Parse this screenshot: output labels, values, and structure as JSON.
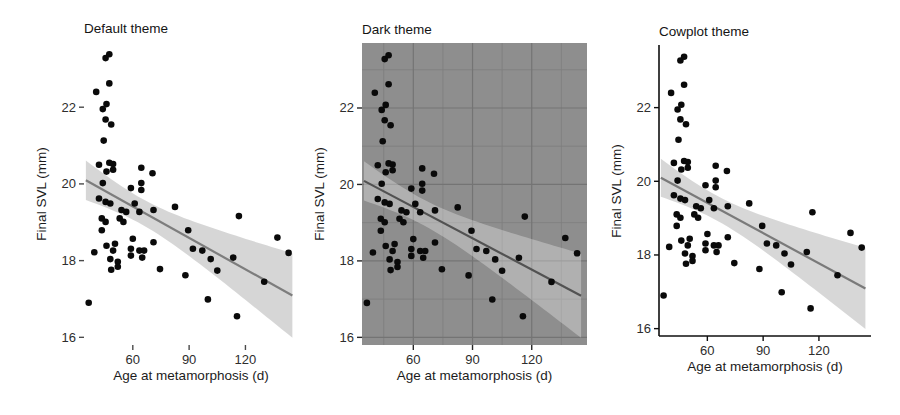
{
  "figure": {
    "background": "#ffffff",
    "text_color": "#1c1c1c"
  },
  "chart_data": {
    "type": "scatter",
    "xlabel": "Age at metamorphosis (d)",
    "ylabel": "Final SVL (mm)",
    "x_domain": [
      34,
      148
    ],
    "y_domain": [
      15.8,
      23.7
    ],
    "x_ticks": [
      60,
      90,
      120
    ],
    "y_ticks": [
      16,
      18,
      20,
      22
    ],
    "x_minor": [
      45,
      75,
      105,
      135
    ],
    "y_minor": [
      17,
      19,
      21,
      23
    ],
    "grid_note": "gridlines visible only in dark theme panel",
    "smooth": {
      "method": "linear-regression",
      "ci_level": 0.95,
      "t_multiplier": 1.96,
      "x_range": [
        35,
        145
      ]
    },
    "points": [
      [
        45.5,
        23.28
      ],
      [
        47.5,
        23.38
      ],
      [
        47.5,
        22.62
      ],
      [
        40.5,
        22.4
      ],
      [
        46,
        22.08
      ],
      [
        44,
        21.95
      ],
      [
        45.5,
        21.68
      ],
      [
        48.5,
        21.55
      ],
      [
        44.5,
        21.13
      ],
      [
        42,
        20.5
      ],
      [
        47.5,
        20.55
      ],
      [
        49.5,
        20.52
      ],
      [
        46,
        20.32
      ],
      [
        49.5,
        20.37
      ],
      [
        64.5,
        20.42
      ],
      [
        70.5,
        20.28
      ],
      [
        44,
        20.02
      ],
      [
        64.5,
        20.02
      ],
      [
        59,
        19.89
      ],
      [
        64.5,
        19.84
      ],
      [
        42,
        19.62
      ],
      [
        45.5,
        19.53
      ],
      [
        48,
        19.49
      ],
      [
        54,
        19.32
      ],
      [
        56.5,
        19.27
      ],
      [
        61,
        19.49
      ],
      [
        63.5,
        19.27
      ],
      [
        71,
        19.32
      ],
      [
        82.5,
        19.4
      ],
      [
        43.5,
        19.1
      ],
      [
        45.5,
        19.01
      ],
      [
        53,
        19.1
      ],
      [
        55,
        19.01
      ],
      [
        43.5,
        18.79
      ],
      [
        46,
        18.39
      ],
      [
        50.5,
        18.44
      ],
      [
        49.5,
        18.26
      ],
      [
        39.5,
        18.22
      ],
      [
        60,
        18.57
      ],
      [
        59,
        18.31
      ],
      [
        63.5,
        18.26
      ],
      [
        66,
        18.26
      ],
      [
        71,
        18.48
      ],
      [
        116.5,
        19.16
      ],
      [
        137,
        18.6
      ],
      [
        89.5,
        18.79
      ],
      [
        92,
        18.31
      ],
      [
        97,
        18.26
      ],
      [
        101.5,
        18.04
      ],
      [
        113.5,
        18.08
      ],
      [
        143,
        18.2
      ],
      [
        48,
        18.04
      ],
      [
        52,
        17.97
      ],
      [
        48.5,
        17.76
      ],
      [
        52,
        17.84
      ],
      [
        36.5,
        16.9
      ],
      [
        74.5,
        17.78
      ],
      [
        88,
        17.62
      ],
      [
        59,
        18.13
      ],
      [
        65,
        18.08
      ],
      [
        105,
        17.74
      ],
      [
        100,
        16.99
      ],
      [
        115.5,
        16.55
      ],
      [
        130,
        17.45
      ]
    ],
    "panels": [
      {
        "title": "Default theme",
        "slug": "default-theme",
        "rect": {
          "l": 84,
          "t": 42,
          "r": 298,
          "b": 345
        },
        "style": {
          "panel_bg": "#ffffff",
          "grid_major": null,
          "grid_minor": null,
          "axis_line": null,
          "tick_color": "#4a4a4a",
          "tick_label_color": "#2d2d2d",
          "band_color": "rgba(0,0,0,0.16)",
          "line_color": "#7d7d7d",
          "point_color": "#0a0a0a"
        }
      },
      {
        "title": "Dark theme",
        "slug": "dark-theme",
        "rect": {
          "l": 362,
          "t": 43,
          "r": 587,
          "b": 345
        },
        "style": {
          "panel_bg": "#8e8e8e",
          "grid_major": "#747474",
          "grid_minor": "#7e7e7e",
          "axis_line": null,
          "tick_color": "#262626",
          "tick_label_color": "#2d2d2d",
          "band_color": "rgba(255,255,255,0.30)",
          "line_color": "#525252",
          "point_color": "#0a0a0a"
        }
      },
      {
        "title": "Cowplot theme",
        "slug": "cowplot-theme",
        "rect": {
          "l": 659,
          "t": 45,
          "r": 871,
          "b": 336
        },
        "style": {
          "panel_bg": "#ffffff",
          "grid_major": null,
          "grid_minor": null,
          "axis_line": "#0f0f0f",
          "tick_color": "#0f0f0f",
          "tick_label_color": "#2d2d2d",
          "band_color": "rgba(0,0,0,0.155)",
          "line_color": "#7a7a7a",
          "point_color": "#0a0a0a"
        }
      }
    ]
  }
}
